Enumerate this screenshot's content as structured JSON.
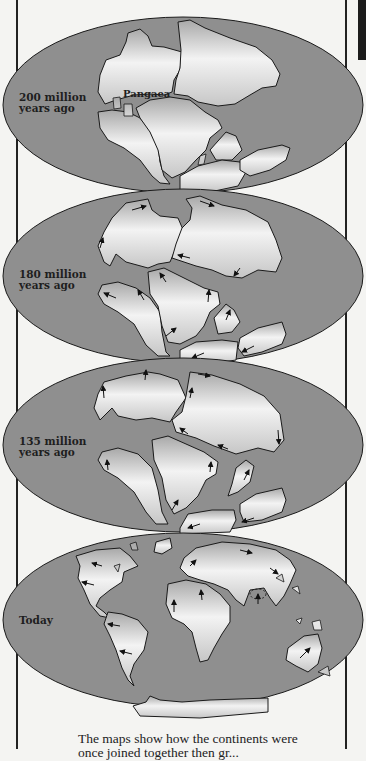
{
  "figure": {
    "maps": [
      {
        "id": "200mya",
        "label_line1": "200 million",
        "label_line2": "years ago",
        "annotation": "Pangaea"
      },
      {
        "id": "180mya",
        "label_line1": "180 million",
        "label_line2": "years ago"
      },
      {
        "id": "135mya",
        "label_line1": "135 million",
        "label_line2": "years ago"
      },
      {
        "id": "today",
        "label_line1": "Today",
        "label_line2": ""
      }
    ],
    "caption_line1": "The maps show how the continents were",
    "caption_line2": "once joined together then gr..."
  },
  "colors": {
    "ocean": "#8f8f8f",
    "land_light": "#f2f2f2",
    "land_dark": "#a9a9a9",
    "outline": "#1a1a1a",
    "background": "#f4f4f2"
  }
}
